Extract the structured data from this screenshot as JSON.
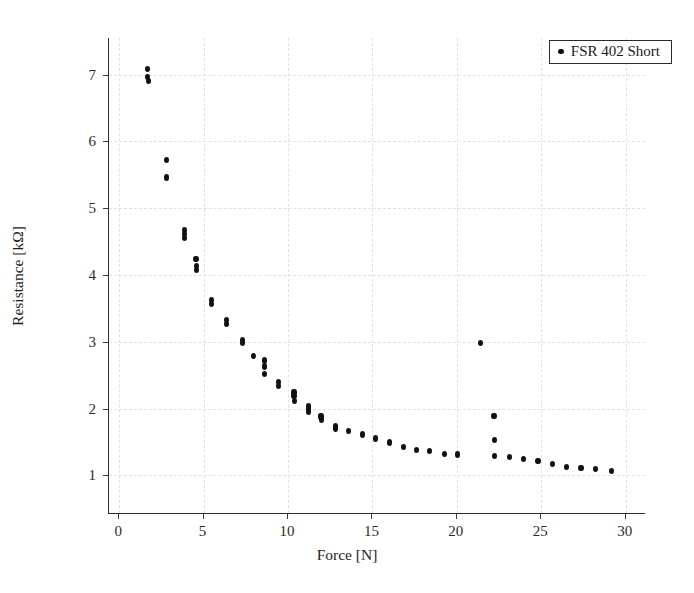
{
  "chart_data": {
    "type": "scatter",
    "title": "",
    "xlabel": "Force [N]",
    "ylabel": "Resistance [kΩ]",
    "xlim": [
      -0.6,
      31.2
    ],
    "ylim": [
      0.42,
      7.55
    ],
    "xticks": [
      0,
      5,
      10,
      15,
      20,
      25,
      30
    ],
    "yticks": [
      1,
      2,
      3,
      4,
      5,
      6,
      7
    ],
    "xtick_labels": [
      "0",
      "5",
      "10",
      "15",
      "20",
      "25",
      "30"
    ],
    "ytick_labels": [
      "1",
      "2",
      "3",
      "4",
      "5",
      "6",
      "7"
    ],
    "grid": true,
    "grid_style": "dashed",
    "grid_color": "#e2e2e2",
    "legend_position": "top-right",
    "marker": "dot",
    "marker_color": "#111111",
    "series": [
      {
        "name": "FSR 402 Short",
        "color": "#111111",
        "points": [
          [
            1.7,
            7.08
          ],
          [
            1.7,
            6.97
          ],
          [
            1.72,
            6.9
          ],
          [
            2.8,
            5.72
          ],
          [
            2.82,
            5.46
          ],
          [
            3.85,
            4.68
          ],
          [
            3.86,
            4.62
          ],
          [
            3.87,
            4.56
          ],
          [
            4.55,
            4.24
          ],
          [
            4.56,
            4.13
          ],
          [
            4.57,
            4.07
          ],
          [
            5.45,
            3.62
          ],
          [
            5.46,
            3.56
          ],
          [
            6.35,
            3.33
          ],
          [
            6.36,
            3.27
          ],
          [
            7.3,
            3.03
          ],
          [
            7.31,
            2.98
          ],
          [
            7.95,
            2.79
          ],
          [
            8.6,
            2.72
          ],
          [
            8.62,
            2.63
          ],
          [
            8.63,
            2.52
          ],
          [
            9.45,
            2.4
          ],
          [
            9.46,
            2.34
          ],
          [
            10.35,
            2.24
          ],
          [
            10.36,
            2.19
          ],
          [
            10.38,
            2.11
          ],
          [
            11.2,
            2.04
          ],
          [
            11.22,
            2.0
          ],
          [
            11.23,
            1.95
          ],
          [
            11.95,
            1.88
          ],
          [
            11.96,
            1.83
          ],
          [
            12.8,
            1.74
          ],
          [
            12.82,
            1.7
          ],
          [
            13.6,
            1.66
          ],
          [
            14.4,
            1.61
          ],
          [
            15.2,
            1.55
          ],
          [
            16.0,
            1.49
          ],
          [
            16.85,
            1.42
          ],
          [
            17.6,
            1.38
          ],
          [
            18.4,
            1.36
          ],
          [
            19.25,
            1.32
          ],
          [
            20.05,
            1.31
          ],
          [
            21.4,
            2.98
          ],
          [
            22.2,
            1.89
          ],
          [
            22.22,
            1.53
          ],
          [
            22.23,
            1.29
          ],
          [
            23.1,
            1.27
          ],
          [
            23.95,
            1.24
          ],
          [
            24.8,
            1.21
          ],
          [
            25.65,
            1.17
          ],
          [
            26.5,
            1.13
          ],
          [
            27.35,
            1.11
          ],
          [
            28.2,
            1.09
          ],
          [
            29.15,
            1.06
          ]
        ]
      }
    ]
  },
  "legend": {
    "entries": [
      {
        "label": "FSR 402 Short",
        "marker": "dot-marker"
      }
    ]
  }
}
